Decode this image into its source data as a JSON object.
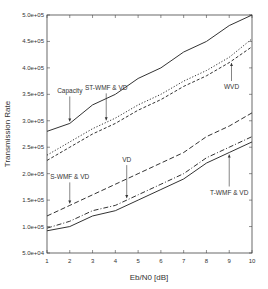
{
  "chart_data": {
    "type": "line",
    "title": "",
    "xlabel": "Eb/N0  [dB]",
    "ylabel": "Transmission Rate",
    "xlim": [
      1,
      10
    ],
    "ylim": [
      50000,
      500000
    ],
    "xticks": [
      "1",
      "2",
      "3",
      "4",
      "5",
      "6",
      "7",
      "8",
      "9",
      "10"
    ],
    "yticks": [
      "5.0e+04",
      "1.0e+05",
      "1.5e+05",
      "2.0e+05",
      "2.5e+05",
      "3.0e+05",
      "3.5e+05",
      "4.0e+05",
      "4.5e+05",
      "5.0e+05"
    ],
    "ytick_values": [
      50000,
      100000,
      150000,
      200000,
      250000,
      300000,
      350000,
      400000,
      450000,
      500000
    ],
    "grid": false,
    "x": [
      1,
      2,
      3,
      4,
      5,
      6,
      7,
      8,
      9,
      10
    ],
    "series": [
      {
        "name": "Capacity",
        "style": "solid",
        "values": [
          280000,
          295000,
          330000,
          350000,
          380000,
          400000,
          430000,
          450000,
          480000,
          500000
        ]
      },
      {
        "name": "ST-WMF & VD",
        "style": "dotted",
        "values": [
          235000,
          260000,
          285000,
          305000,
          330000,
          350000,
          375000,
          395000,
          420000,
          455000
        ]
      },
      {
        "name": "WVD",
        "style": "dashed",
        "values": [
          225000,
          250000,
          275000,
          295000,
          320000,
          340000,
          365000,
          385000,
          410000,
          440000
        ]
      },
      {
        "name": "S-WMF & VD",
        "style": "longdash",
        "values": [
          120000,
          140000,
          160000,
          180000,
          200000,
          220000,
          240000,
          270000,
          290000,
          315000
        ]
      },
      {
        "name": "VD",
        "style": "dashdot",
        "values": [
          97000,
          110000,
          130000,
          140000,
          160000,
          180000,
          200000,
          230000,
          250000,
          270000
        ]
      },
      {
        "name": "T-WMF & VD",
        "style": "solid",
        "values": [
          92000,
          100000,
          120000,
          130000,
          150000,
          170000,
          190000,
          220000,
          240000,
          260000
        ]
      }
    ],
    "annotations": [
      {
        "text": "Capacity",
        "series": "Capacity",
        "arrow_x": 2.0
      },
      {
        "text": "ST-WMF & VD",
        "series": "ST-WMF & VD",
        "arrow_x": 3.6
      },
      {
        "text": "WVD",
        "series": "WVD",
        "arrow_x": 9.1
      },
      {
        "text": "S-WMF & VD",
        "series": "S-WMF & VD",
        "arrow_x": 2.0
      },
      {
        "text": "VD",
        "series": "VD",
        "arrow_x": 4.5
      },
      {
        "text": "T-WMF & VD",
        "series": "T-WMF & VD",
        "arrow_x": 9.0
      }
    ]
  }
}
